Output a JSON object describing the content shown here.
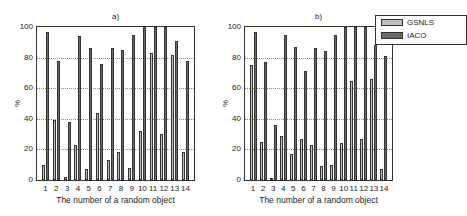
{
  "colors": {
    "gsnls": "#bdbdbd",
    "iaco": "#6a6a6a"
  },
  "legend": {
    "items": [
      {
        "label": "GSNLS",
        "color": "#bdbdbd"
      },
      {
        "label": "IACO",
        "color": "#6a6a6a"
      }
    ]
  },
  "chart_data": [
    {
      "type": "bar",
      "title": "a)",
      "xlabel": "The number of a random object",
      "ylabel": "%",
      "ylim": [
        0,
        100
      ],
      "yticks": [
        "0",
        "20",
        "40",
        "60",
        "80",
        "100"
      ],
      "grid": true,
      "categories": [
        "1",
        "2",
        "3",
        "4",
        "5",
        "6",
        "7",
        "8",
        "9",
        "10",
        "11",
        "12",
        "13",
        "14"
      ],
      "series": [
        {
          "name": "GSNLS",
          "values": [
            10,
            39,
            2,
            23,
            7,
            44,
            13,
            18,
            8,
            32,
            83,
            30,
            82,
            18
          ]
        },
        {
          "name": "IACO",
          "values": [
            97,
            78,
            38,
            94,
            86,
            76,
            86,
            85,
            95,
            100,
            100,
            100,
            91,
            78
          ]
        }
      ]
    },
    {
      "type": "bar",
      "title": "b)",
      "xlabel": "The number of a random object",
      "ylabel": "%",
      "ylim": [
        0,
        100
      ],
      "yticks": [
        "0",
        "20",
        "40",
        "60",
        "80",
        "100"
      ],
      "grid": true,
      "legend_position": "top-right (outside)",
      "categories": [
        "1",
        "2",
        "3",
        "4",
        "5",
        "6",
        "7",
        "8",
        "9",
        "10",
        "11",
        "12",
        "13",
        "14"
      ],
      "series": [
        {
          "name": "GSNLS",
          "values": [
            75,
            25,
            1,
            29,
            17,
            27,
            23,
            9,
            10,
            24,
            65,
            27,
            66,
            7
          ]
        },
        {
          "name": "IACO",
          "values": [
            97,
            77,
            36,
            95,
            87,
            71,
            86,
            84,
            95,
            100,
            100,
            100,
            88,
            81
          ]
        }
      ]
    }
  ]
}
